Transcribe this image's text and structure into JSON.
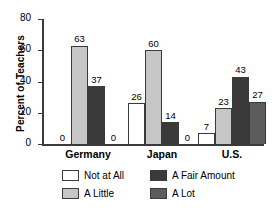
{
  "chart_data": {
    "type": "bar",
    "title": "",
    "xlabel": "",
    "ylabel": "Percent of Teachers",
    "ylim": [
      0,
      80
    ],
    "yticks": [
      0,
      20,
      40,
      60,
      80
    ],
    "grid": false,
    "legend_position": "bottom",
    "categories": [
      "Germany",
      "Japan",
      "U.S."
    ],
    "series": [
      {
        "name": "Not at All",
        "color": "#ffffff",
        "values": [
          0,
          26,
          7
        ]
      },
      {
        "name": "A Little",
        "color": "#c6c6c6",
        "values": [
          63,
          60,
          23
        ]
      },
      {
        "name": "A Fair Amount",
        "color": "#3a3a3a",
        "values": [
          37,
          14,
          43
        ]
      },
      {
        "name": "A Lot",
        "color": "#5c5c5c",
        "values": [
          0,
          0,
          27
        ]
      }
    ]
  },
  "axis": {
    "y_title": "Percent of Teachers",
    "y_ticks": [
      {
        "label": "80"
      },
      {
        "label": "60"
      },
      {
        "label": "40"
      },
      {
        "label": "20"
      },
      {
        "label": "0"
      }
    ]
  },
  "groups": [
    {
      "label": "Germany",
      "bars": [
        {
          "series": "Not at All",
          "value": "0",
          "pct": 0
        },
        {
          "series": "A Little",
          "value": "63",
          "pct": 63
        },
        {
          "series": "A Fair Amount",
          "value": "37",
          "pct": 37
        },
        {
          "series": "A Lot",
          "value": "0",
          "pct": 0
        }
      ]
    },
    {
      "label": "Japan",
      "bars": [
        {
          "series": "Not at All",
          "value": "26",
          "pct": 26
        },
        {
          "series": "A Little",
          "value": "60",
          "pct": 60
        },
        {
          "series": "A Fair Amount",
          "value": "14",
          "pct": 14
        },
        {
          "series": "A Lot",
          "value": "0",
          "pct": 0
        }
      ]
    },
    {
      "label": "U.S.",
      "bars": [
        {
          "series": "Not at All",
          "value": "7",
          "pct": 7
        },
        {
          "series": "A Little",
          "value": "23",
          "pct": 23
        },
        {
          "series": "A Fair Amount",
          "value": "43",
          "pct": 43
        },
        {
          "series": "A Lot",
          "value": "27",
          "pct": 27
        }
      ]
    }
  ],
  "legend": {
    "rows": [
      [
        {
          "label": "Not at All",
          "swatch": "#ffffff"
        },
        {
          "label": "A Fair Amount",
          "swatch": "#3a3a3a"
        }
      ],
      [
        {
          "label": "A Little",
          "swatch": "#c6c6c6"
        },
        {
          "label": "A Lot",
          "swatch": "#5c5c5c"
        }
      ]
    ]
  }
}
